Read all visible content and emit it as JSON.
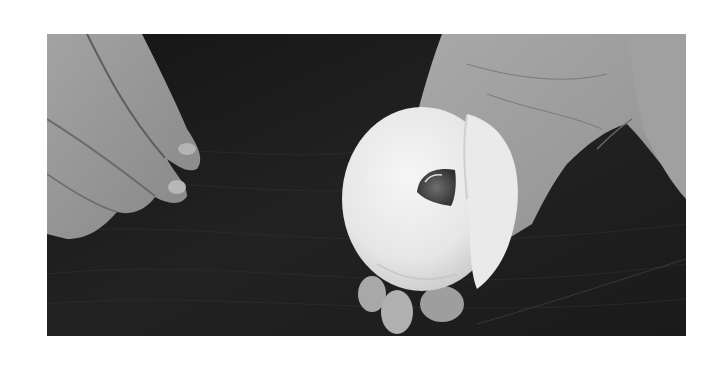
{
  "image": {
    "alt": "Black and white photo of hands shaping a ring of dough on a dark wooden surface",
    "subject": "bagel-dough-ring",
    "style": "grayscale",
    "frame": {
      "left": 47,
      "top": 34,
      "width": 639,
      "height": 302
    },
    "colors": {
      "border": "#ffffff",
      "background_wood": "#1c1c1c",
      "wood_grain": "#2e2e2e",
      "skin_light": "#b8b8b8",
      "skin_mid": "#8f8f8f",
      "skin_shadow": "#5e5e5e",
      "dough": "#eeeeee",
      "dough_shadow": "#c9c9c9",
      "hole_shadow": "#3a3a3a"
    }
  }
}
